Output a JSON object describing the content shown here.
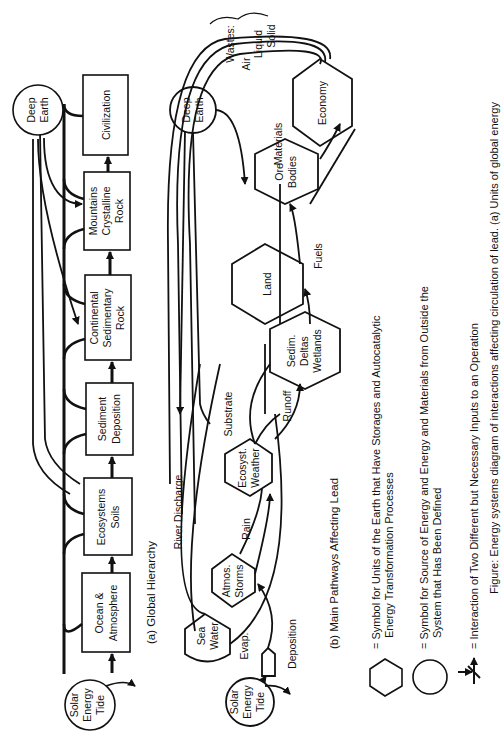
{
  "panel_a": {
    "title": "(a)  Global Hierarchy",
    "sources": {
      "deep_earth": [
        "Deep",
        "Earth"
      ],
      "solar": [
        "Solar",
        "Energy",
        "Tide"
      ]
    },
    "boxes": [
      {
        "lines": [
          "Ocean &",
          "Atmosphere"
        ]
      },
      {
        "lines": [
          "Ecosystems",
          "Soils"
        ]
      },
      {
        "lines": [
          "Sediment",
          "Deposition"
        ]
      },
      {
        "lines": [
          "Continental",
          "Sedimentary",
          "Rock"
        ]
      },
      {
        "lines": [
          "Mountains",
          "Crystalline",
          "Rock"
        ]
      },
      {
        "lines": [
          "Civilization"
        ]
      }
    ]
  },
  "panel_b": {
    "title": "(b) Main Pathways Affecting Lead",
    "sources": {
      "deep_earth": [
        "Deep",
        "Earth"
      ],
      "solar": [
        "Solar",
        "Energy",
        "Tide"
      ]
    },
    "units": {
      "sea_water": [
        "Sea",
        "Water"
      ],
      "atmos": [
        "Atmos.",
        "Storms"
      ],
      "ecosyst": [
        "Ecosyst.",
        "Weather"
      ],
      "sedim": [
        "Sedim.",
        "Deltas",
        "Wetlands"
      ],
      "land": [
        "Land"
      ],
      "ore": [
        "Ore",
        "Bodies"
      ],
      "economy": [
        "Economy"
      ]
    },
    "flow_labels": {
      "evap": "Evap.",
      "deposition": "Deposition",
      "rain": "Rain",
      "river_discharge": "River Discharge",
      "substrate": "Substrate",
      "runoff": "Runoff",
      "fuels": "Fuels",
      "materials": "Materials",
      "wastes": "Wastes:",
      "air": "Air",
      "liquid": "Liquid",
      "solid": "Solid"
    }
  },
  "legend": {
    "hexagon": [
      "= Symbol for  Units of the Earth that Have Storages and Autocatalytic",
      "Energy Transformation  Processes"
    ],
    "circle": [
      "= Symbol for Source of Energy and Energy and Materials from Outside the",
      "System that Has Been Defined"
    ],
    "interaction": [
      "= Interaction of Two Different but Necessary Inputs to an Operation"
    ]
  },
  "caption": "Figure: Energy systems diagram of interactions affecting circulation of lead. (a) Units of global energy"
}
